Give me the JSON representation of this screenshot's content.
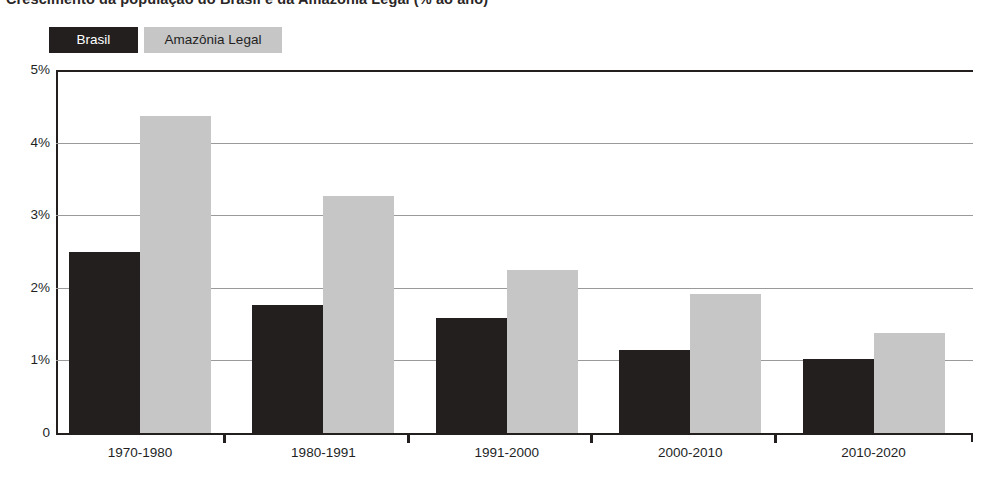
{
  "title": "Crescimento da população do Brasil e da Amazônia Legal (% ao ano)",
  "legend": {
    "items": [
      {
        "label": "Brasil",
        "color": "#231f1f",
        "text_color": "#ffffff"
      },
      {
        "label": "Amazônia Legal",
        "color": "#c6c6c6",
        "text_color": "#231f1f"
      }
    ]
  },
  "axis": {
    "y_ticks": [
      "5%",
      "4%",
      "3%",
      "2%",
      "1%",
      "0"
    ],
    "y_values": [
      5,
      4,
      3,
      2,
      1,
      0
    ]
  },
  "chart_data": {
    "type": "bar",
    "title": "Crescimento da população do Brasil e da Amazônia Legal (% ao ano)",
    "xlabel": "",
    "ylabel": "",
    "ylim": [
      0,
      5
    ],
    "ytick_labels": [
      "0",
      "1%",
      "2%",
      "3%",
      "4%",
      "5%"
    ],
    "grid": true,
    "legend_position": "top-left",
    "categories": [
      "1970-1980",
      "1980-1991",
      "1991-2000",
      "2000-2010",
      "2010-2020"
    ],
    "series": [
      {
        "name": "Brasil",
        "color": "#231f1f",
        "values": [
          2.5,
          1.76,
          1.58,
          1.14,
          1.02
        ]
      },
      {
        "name": "Amazônia Legal",
        "color": "#c6c6c6",
        "values": [
          4.36,
          3.27,
          2.25,
          1.92,
          1.38
        ]
      }
    ]
  }
}
